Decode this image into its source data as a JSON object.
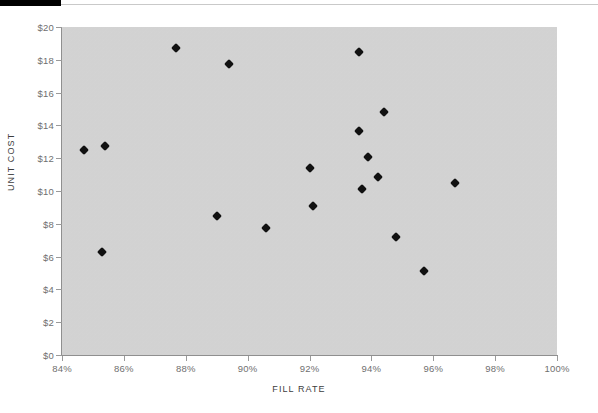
{
  "chart_data": {
    "type": "scatter",
    "title": "",
    "xlabel": "FILL RATE",
    "ylabel": "UNIT COST",
    "xlim": [
      84,
      100
    ],
    "ylim": [
      0,
      20
    ],
    "grid": false,
    "legend": null,
    "x_tick_labels": [
      "84%",
      "86%",
      "88%",
      "90%",
      "92%",
      "94%",
      "96%",
      "98%",
      "100%"
    ],
    "x_tick_values": [
      84,
      86,
      88,
      90,
      92,
      94,
      96,
      98,
      100
    ],
    "y_tick_labels": [
      "$0",
      "$2",
      "$4",
      "$6",
      "$8",
      "$10",
      "$12",
      "$14",
      "$16",
      "$18",
      "$20"
    ],
    "y_tick_values": [
      0,
      2,
      4,
      6,
      8,
      10,
      12,
      14,
      16,
      18,
      20
    ],
    "marker_shape": "diamond",
    "marker_color": "#111111",
    "plot_background": "#d4d4d4",
    "points": [
      {
        "x": 84.7,
        "y": 12.5
      },
      {
        "x": 85.4,
        "y": 12.75
      },
      {
        "x": 85.3,
        "y": 6.3
      },
      {
        "x": 87.7,
        "y": 18.7
      },
      {
        "x": 89.4,
        "y": 17.75
      },
      {
        "x": 89.0,
        "y": 8.5
      },
      {
        "x": 90.6,
        "y": 7.75
      },
      {
        "x": 92.0,
        "y": 11.4
      },
      {
        "x": 92.1,
        "y": 9.1
      },
      {
        "x": 93.6,
        "y": 18.5
      },
      {
        "x": 93.6,
        "y": 13.65
      },
      {
        "x": 94.4,
        "y": 14.8
      },
      {
        "x": 93.9,
        "y": 12.1
      },
      {
        "x": 94.2,
        "y": 10.85
      },
      {
        "x": 93.7,
        "y": 10.1
      },
      {
        "x": 96.7,
        "y": 10.5
      },
      {
        "x": 94.8,
        "y": 7.2
      },
      {
        "x": 95.7,
        "y": 5.1
      }
    ]
  }
}
